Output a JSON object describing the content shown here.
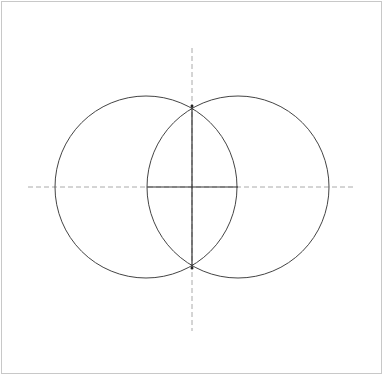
{
  "diagram": {
    "colors": {
      "circle_stroke": "#444444",
      "solid_line": "#333333",
      "dashed_line": "#aaaaaa",
      "border": "#c8c8c8",
      "background": "#ffffff"
    },
    "circles": [
      {
        "name": "left-circle",
        "cx": 146,
        "cy": 187,
        "r": 91
      },
      {
        "name": "right-circle",
        "cx": 238,
        "cy": 187,
        "r": 91
      }
    ],
    "intersection_points": [
      {
        "name": "top-intersection",
        "x": 192,
        "y": 106
      },
      {
        "name": "bottom-intersection",
        "x": 192,
        "y": 268
      }
    ],
    "solid_lines": [
      {
        "name": "vertical-chord",
        "x1": 192,
        "y1": 106,
        "x2": 192,
        "y2": 268
      },
      {
        "name": "center-segment",
        "x1": 147,
        "y1": 187,
        "x2": 238,
        "y2": 187
      }
    ],
    "dashed_lines": [
      {
        "name": "horizontal-axis",
        "x1": 28,
        "y1": 187,
        "x2": 355,
        "y2": 187
      },
      {
        "name": "vertical-axis",
        "x1": 192,
        "y1": 48,
        "x2": 192,
        "y2": 331
      }
    ]
  }
}
